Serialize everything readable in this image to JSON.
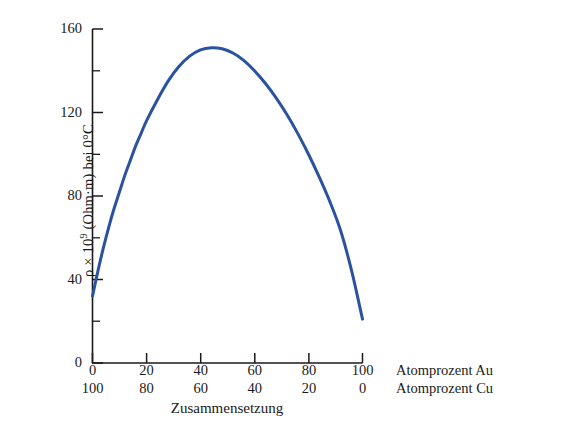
{
  "chart_data": {
    "type": "line",
    "title": "",
    "subtitle": "",
    "ylabel": "ρ × 10⁹ (Ohm·m) bei 0°C",
    "ylabel_parts": {
      "rho": "ρ",
      "times": "×",
      "base": "10",
      "exponent": "9",
      "units": "(Ohm·m)",
      "condition": "bei 0°C"
    },
    "xlabel": "Zusammensetzung",
    "xlim": [
      0,
      100
    ],
    "ylim": [
      0,
      160
    ],
    "grid": false,
    "legend": null,
    "line_color": "#2a52a0",
    "line_width": 3.0,
    "axis_color": "#1a1a1a",
    "y_major_ticks": [
      0,
      40,
      80,
      120,
      160
    ],
    "y_minor_ticks": [
      20,
      60,
      100,
      140
    ],
    "y_tick_labels": [
      "0",
      "40",
      "80",
      "120",
      "160"
    ],
    "x_major_ticks": [
      0,
      20,
      40,
      60,
      80,
      100
    ],
    "x_tick_labels_top": [
      "0",
      "20",
      "40",
      "60",
      "80",
      "100"
    ],
    "x_tick_labels_bottom": [
      "100",
      "80",
      "60",
      "40",
      "20",
      "0"
    ],
    "x_axis_caption_top": "Atomprozent Au",
    "x_axis_caption_bottom": "Atomprozent Cu",
    "series": [
      {
        "name": "Elektrischer Widerstand Cu-Au",
        "x": [
          0,
          2,
          4,
          6,
          8,
          10,
          12,
          14,
          16,
          18,
          20,
          24,
          28,
          32,
          36,
          40,
          44,
          48,
          52,
          56,
          60,
          64,
          68,
          72,
          76,
          80,
          84,
          88,
          92,
          96,
          100
        ],
        "y": [
          32,
          44,
          55,
          65,
          74,
          82,
          90,
          97,
          104,
          110,
          116,
          126,
          135,
          142,
          147,
          150,
          151,
          150.5,
          148.5,
          145,
          140,
          134,
          127,
          119,
          110,
          100,
          89,
          77,
          63,
          44,
          21
        ]
      }
    ],
    "annotations": {
      "peak_x": 44,
      "peak_y": 151,
      "left_endpoint_y": 32,
      "right_endpoint_y": 21
    }
  },
  "axes": {
    "y_labels": [
      "160",
      "120",
      "80",
      "40",
      "0"
    ],
    "x_labels_row1": [
      "0",
      "20",
      "40",
      "60",
      "80",
      "100"
    ],
    "x_labels_row2": [
      "100",
      "80",
      "60",
      "40",
      "20",
      "0"
    ],
    "captions": {
      "row1": "Atomprozent Au",
      "row2": "Atomprozent Cu"
    },
    "x_title": "Zusammensetzung"
  },
  "ylabel_text": {
    "rho": "ρ",
    "mid": " × 10",
    "exp": "9",
    "tail": " (Ohm·m) bei 0°C"
  }
}
